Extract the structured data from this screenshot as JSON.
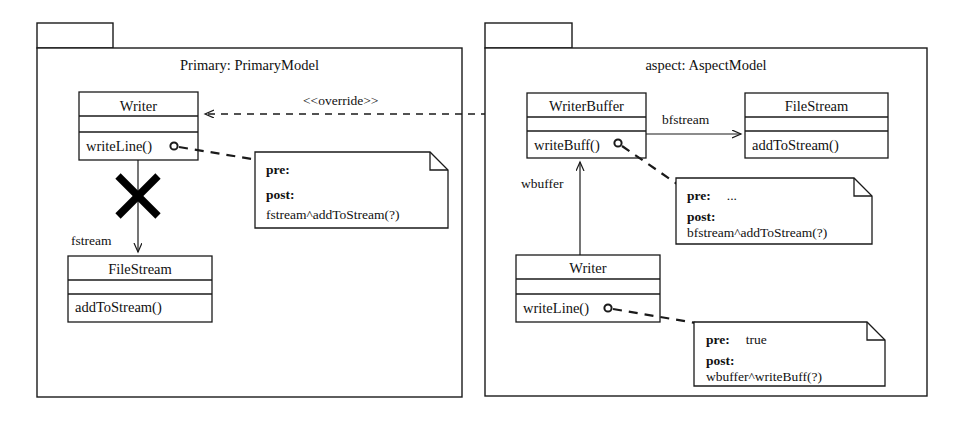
{
  "diagram": {
    "type": "uml-class-diagram",
    "title_visible": false,
    "stereotype_label": "<<override>>"
  },
  "packages": [
    {
      "id": "primary",
      "title": "Primary: PrimaryModel",
      "tab_label": ""
    },
    {
      "id": "aspect",
      "title": "aspect: AspectModel",
      "tab_label": ""
    }
  ],
  "classes": [
    {
      "id": "primary-writer",
      "name": "Writer",
      "attributes": "",
      "operations": "writeLine()",
      "package": "primary"
    },
    {
      "id": "primary-filestream",
      "name": "FileStream",
      "attributes": "",
      "operations": "addToStream()",
      "package": "primary"
    },
    {
      "id": "aspect-writerbuffer",
      "name": "WriterBuffer",
      "attributes": "",
      "operations": "writeBuff()",
      "package": "aspect"
    },
    {
      "id": "aspect-filestream",
      "name": "FileStream",
      "attributes": "",
      "operations": "addToStream()",
      "package": "aspect"
    },
    {
      "id": "aspect-writer",
      "name": "Writer",
      "attributes": "",
      "operations": "writeLine()",
      "package": "aspect"
    }
  ],
  "associations": [
    {
      "id": "fstream",
      "label": "fstream",
      "from": "primary-writer",
      "to": "primary-filestream",
      "crossed_out": true
    },
    {
      "id": "bfstream",
      "label": "bfstream",
      "from": "aspect-writerbuffer",
      "to": "aspect-filestream",
      "crossed_out": false
    },
    {
      "id": "wbuffer",
      "label": "wbuffer",
      "from": "aspect-writer",
      "to": "aspect-writerbuffer",
      "crossed_out": false
    }
  ],
  "notes": [
    {
      "id": "note-primary-writeline",
      "pre_key": "pre:",
      "pre_value": "",
      "post_key": "post:",
      "post_value": "fstream^addToStream(?)",
      "anchor": "primary-writer.writeLine()"
    },
    {
      "id": "note-aspect-writebuff",
      "pre_key": "pre:",
      "pre_value": "...",
      "post_key": "post:",
      "post_value": "bfstream^addToStream(?)",
      "anchor": "aspect-writerbuffer.writeBuff()"
    },
    {
      "id": "note-aspect-writeline",
      "pre_key": "pre:",
      "pre_value": "true",
      "post_key": "post:",
      "post_value": "wbuffer^writeBuff(?)",
      "anchor": "aspect-writer.writeLine()"
    }
  ],
  "colors": {
    "stroke": "#1a1a1a",
    "fill": "#ffffff",
    "crossmark": "#000000"
  }
}
